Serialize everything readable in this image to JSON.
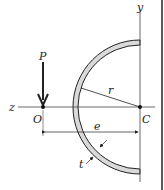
{
  "diagram": {
    "type": "engineering-figure",
    "labels": {
      "load": "P",
      "origin": "O",
      "center": "C",
      "radius": "r",
      "eccentricity": "e",
      "thickness": "t",
      "z_axis": "z",
      "y_axis": "y"
    },
    "colors": {
      "wall_fill": "#d9d9d9",
      "stroke": "#222222",
      "background": "#ffffff"
    }
  }
}
